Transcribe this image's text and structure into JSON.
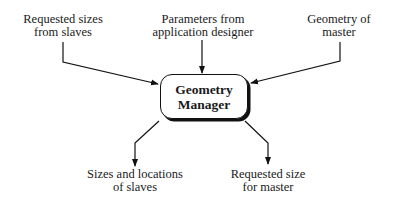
{
  "diagram": {
    "center": {
      "line1": "Geometry",
      "line2": "Manager"
    },
    "inputs": [
      {
        "line1": "Requested sizes",
        "line2": "from slaves"
      },
      {
        "line1": "Parameters from",
        "line2": "application designer"
      },
      {
        "line1": "Geometry of",
        "line2": "master"
      }
    ],
    "outputs": [
      {
        "line1": "Sizes and locations",
        "line2": "of slaves"
      },
      {
        "line1": "Requested size",
        "line2": "for master"
      }
    ],
    "colors": {
      "line": "#111111",
      "text": "#1a1a1a",
      "background": "#ffffff"
    }
  }
}
